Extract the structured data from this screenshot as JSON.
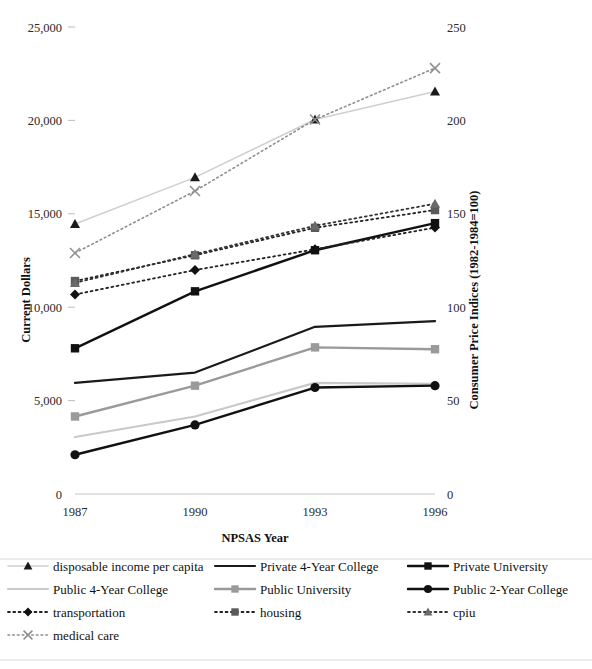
{
  "chart_data": {
    "type": "line",
    "title": "",
    "xlabel": "NPSAS Year",
    "ylabel": "Current Dollars",
    "y2label": "Consumer Price Indices (1982-1984=100)",
    "grid": false,
    "legend_position": "bottom",
    "categories": [
      "1987",
      "1990",
      "1993",
      "1996"
    ],
    "x": [
      1987,
      1990,
      1993,
      1996
    ],
    "ylim": [
      0,
      25000
    ],
    "y2lim": [
      0,
      250
    ],
    "yticks": [
      "0",
      "5,000",
      "10,000",
      "15,000",
      "20,000",
      "25,000"
    ],
    "ytick_values": [
      0,
      5000,
      10000,
      15000,
      20000,
      25000
    ],
    "y2ticks": [
      "0",
      "50",
      "100",
      "150",
      "200",
      "250"
    ],
    "y2tick_values": [
      0,
      50,
      100,
      150,
      200,
      250
    ],
    "xtick_labels": [
      "1987",
      "1990",
      "1993",
      "1996"
    ],
    "series": [
      {
        "name": "disposable income per capita",
        "axis": "left",
        "values": [
          14450,
          16950,
          20050,
          21550
        ],
        "color": "#cfcfcf",
        "marker": "triangle",
        "marker_color": "#1a1a1a",
        "dash": "solid",
        "width": 1.6
      },
      {
        "name": "Private 4-Year College",
        "axis": "left",
        "values": [
          5950,
          6500,
          8950,
          9250
        ],
        "color": "#1a1a1a",
        "marker": "none",
        "marker_color": "#1a1a1a",
        "dash": "solid",
        "width": 2.2
      },
      {
        "name": "Private University",
        "axis": "left",
        "values": [
          7800,
          10850,
          13050,
          14500
        ],
        "color": "#111111",
        "marker": "square",
        "marker_color": "#111111",
        "dash": "solid",
        "width": 2.4
      },
      {
        "name": "Public 4-Year College",
        "axis": "left",
        "values": [
          3050,
          4150,
          5950,
          5900
        ],
        "color": "#c9c9c9",
        "marker": "none",
        "marker_color": "#c9c9c9",
        "dash": "solid",
        "width": 2.2
      },
      {
        "name": "Public University",
        "axis": "left",
        "values": [
          4150,
          5800,
          7850,
          7750
        ],
        "color": "#9a9a9a",
        "marker": "square",
        "marker_color": "#9a9a9a",
        "dash": "solid",
        "width": 2.4
      },
      {
        "name": "Public 2-Year College",
        "axis": "left",
        "values": [
          2100,
          3700,
          5700,
          5800
        ],
        "color": "#111111",
        "marker": "circle",
        "marker_color": "#111111",
        "dash": "solid",
        "width": 2.4
      },
      {
        "name": "transportation",
        "axis": "right",
        "values": [
          106.8,
          119.9,
          131.0,
          142.6
        ],
        "color": "#222222",
        "marker": "diamond",
        "marker_color": "#111111",
        "dash": "dotted",
        "width": 1.8
      },
      {
        "name": "housing",
        "axis": "right",
        "values": [
          114.0,
          127.8,
          142.5,
          152.0
        ],
        "color": "#222222",
        "marker": "square",
        "marker_color": "#5a5a5a",
        "dash": "dotted",
        "width": 1.8
      },
      {
        "name": "cpiu",
        "axis": "right",
        "values": [
          113.0,
          128.4,
          143.6,
          155.4
        ],
        "color": "#333333",
        "marker": "triangle",
        "marker_color": "#6a6a6a",
        "dash": "dotted",
        "width": 1.8
      },
      {
        "name": "medical care",
        "axis": "right",
        "values": [
          129.0,
          162.2,
          200.5,
          228.0
        ],
        "color": "#8e8e8e",
        "marker": "cross",
        "marker_color": "#8e8e8e",
        "dash": "dotted",
        "width": 1.6
      }
    ]
  },
  "legend": {
    "rows": [
      [
        {
          "label": "disposable income per capita",
          "series": 0
        },
        {
          "label": "Private 4-Year College",
          "series": 1
        },
        {
          "label": "Private University",
          "series": 2
        }
      ],
      [
        {
          "label": "Public 4-Year College",
          "series": 3
        },
        {
          "label": "Public University",
          "series": 4
        },
        {
          "label": "Public 2-Year College",
          "series": 5
        }
      ],
      [
        {
          "label": "transportation",
          "series": 6
        },
        {
          "label": "housing",
          "series": 7
        },
        {
          "label": "cpiu",
          "series": 8
        }
      ],
      [
        {
          "label": "medical care",
          "series": 9
        }
      ]
    ]
  }
}
